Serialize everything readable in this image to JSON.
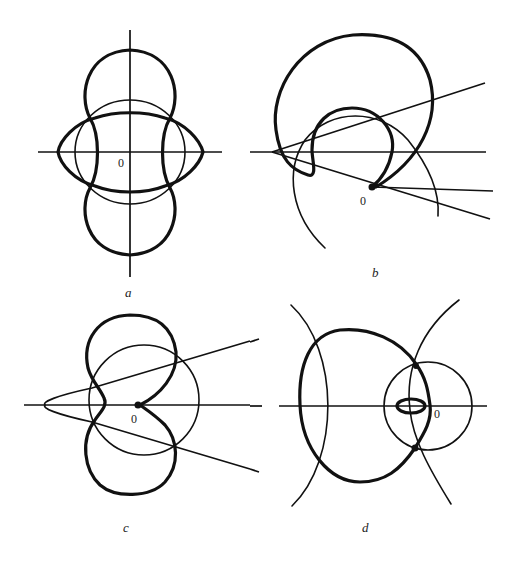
{
  "figure": {
    "panels": [
      {
        "id": "a",
        "label": "a",
        "origin_label": "0"
      },
      {
        "id": "b",
        "label": "b",
        "origin_label": "0"
      },
      {
        "id": "c",
        "label": "c",
        "origin_label": "0"
      },
      {
        "id": "d",
        "label": "d",
        "origin_label": "0"
      }
    ]
  },
  "colors": {
    "stroke": "#111111",
    "background": "#ffffff"
  }
}
